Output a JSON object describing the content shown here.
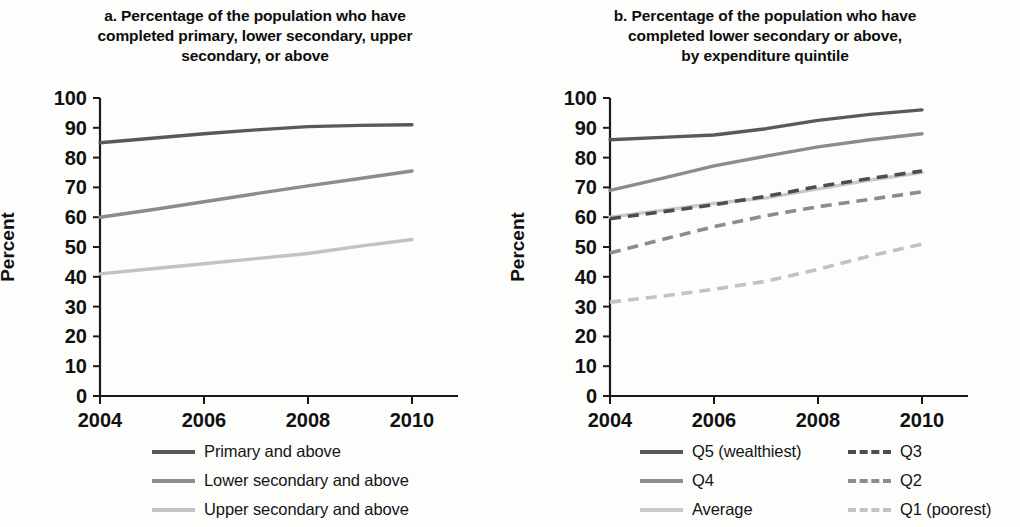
{
  "figure": {
    "ylabel": "Percent",
    "ytick_labels": [
      "0",
      "10",
      "20",
      "30",
      "40",
      "50",
      "60",
      "70",
      "80",
      "90",
      "100"
    ],
    "xtick_labels": [
      "2004",
      "2006",
      "2008",
      "2010"
    ]
  },
  "panel_a": {
    "title_line1": "a. Percentage of the population who have",
    "title_line2": "completed primary, lower secondary, upper",
    "title_line3": "secondary, or above",
    "legend": [
      {
        "label": "Primary and above",
        "color": "#595959",
        "dash": "none"
      },
      {
        "label": "Lower secondary and above",
        "color": "#8c8c8c",
        "dash": "none"
      },
      {
        "label": "Upper secondary and above",
        "color": "#c2c2c2",
        "dash": "none"
      }
    ]
  },
  "panel_b": {
    "title_line1": "b. Percentage of the population who have",
    "title_line2": "completed lower secondary or above,",
    "title_line3": "by expenditure quintile",
    "legend_left": [
      {
        "label": "Q5 (wealthiest)",
        "color": "#595959",
        "dash": "none"
      },
      {
        "label": "Q4",
        "color": "#8c8c8c",
        "dash": "none"
      },
      {
        "label": "Average",
        "color": "#c9c9c9",
        "dash": "none"
      }
    ],
    "legend_right": [
      {
        "label": "Q3",
        "color": "#4d4d4d",
        "dash": "dashed"
      },
      {
        "label": "Q2",
        "color": "#8c8c8c",
        "dash": "dashed"
      },
      {
        "label": "Q1 (poorest)",
        "color": "#c2c2c2",
        "dash": "dashed"
      }
    ]
  },
  "chart_data": [
    {
      "type": "line",
      "panel": "a",
      "title": "a. Percentage of the population who have completed primary, lower secondary, upper secondary, or above",
      "xlabel": "",
      "ylabel": "Percent",
      "ylim": [
        0,
        100
      ],
      "xlim": [
        2004,
        2010
      ],
      "yticks": [
        0,
        10,
        20,
        30,
        40,
        50,
        60,
        70,
        80,
        90,
        100
      ],
      "xticks": [
        2004,
        2006,
        2008,
        2010
      ],
      "grid": false,
      "legend_position": "below",
      "x": [
        2004,
        2005,
        2006,
        2007,
        2008,
        2009,
        2010
      ],
      "series": [
        {
          "name": "Primary and above",
          "color": "#595959",
          "dash": "none",
          "values": [
            85.0,
            86.5,
            88.0,
            89.3,
            90.4,
            90.8,
            91.0
          ]
        },
        {
          "name": "Lower secondary and above",
          "color": "#8c8c8c",
          "dash": "none",
          "values": [
            60.0,
            62.5,
            65.2,
            67.9,
            70.5,
            73.0,
            75.5
          ]
        },
        {
          "name": "Upper secondary and above",
          "color": "#c2c2c2",
          "dash": "none",
          "values": [
            41.0,
            42.7,
            44.4,
            46.1,
            47.8,
            50.3,
            52.5
          ]
        }
      ]
    },
    {
      "type": "line",
      "panel": "b",
      "title": "b. Percentage of the population who have completed lower secondary or above, by expenditure quintile",
      "xlabel": "",
      "ylabel": "Percent",
      "ylim": [
        0,
        100
      ],
      "xlim": [
        2004,
        2010
      ],
      "yticks": [
        0,
        10,
        20,
        30,
        40,
        50,
        60,
        70,
        80,
        90,
        100
      ],
      "xticks": [
        2004,
        2006,
        2008,
        2010
      ],
      "grid": false,
      "legend_position": "below",
      "x": [
        2004,
        2005,
        2006,
        2007,
        2008,
        2009,
        2010
      ],
      "series": [
        {
          "name": "Q5 (wealthiest)",
          "color": "#595959",
          "dash": "none",
          "values": [
            86.0,
            86.8,
            87.6,
            89.7,
            92.5,
            94.5,
            96.0
          ]
        },
        {
          "name": "Q4",
          "color": "#8c8c8c",
          "dash": "none",
          "values": [
            69.0,
            73.0,
            77.2,
            80.5,
            83.6,
            86.0,
            88.0
          ]
        },
        {
          "name": "Average",
          "color": "#c9c9c9",
          "dash": "none",
          "values": [
            60.0,
            62.3,
            64.6,
            66.5,
            69.5,
            72.5,
            75.0
          ]
        },
        {
          "name": "Q3",
          "color": "#4d4d4d",
          "dash": "dashed",
          "values": [
            59.5,
            61.8,
            64.2,
            67.0,
            70.3,
            73.0,
            75.5
          ]
        },
        {
          "name": "Q2",
          "color": "#8c8c8c",
          "dash": "dashed",
          "values": [
            48.0,
            52.5,
            56.8,
            60.5,
            63.5,
            66.0,
            68.5
          ]
        },
        {
          "name": "Q1 (poorest)",
          "color": "#c2c2c2",
          "dash": "dashed",
          "values": [
            31.5,
            33.5,
            35.8,
            38.5,
            42.5,
            47.0,
            51.0
          ]
        }
      ]
    }
  ]
}
